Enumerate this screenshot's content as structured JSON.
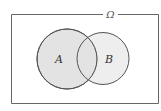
{
  "diagram": {
    "type": "venn",
    "universe": {
      "label": "Ω"
    },
    "sets": [
      {
        "id": "A",
        "label": "A"
      },
      {
        "id": "B",
        "label": "B"
      }
    ],
    "colors": {
      "fill": "#e3e3e3",
      "stroke": "#555555",
      "frame": "#666666"
    }
  }
}
